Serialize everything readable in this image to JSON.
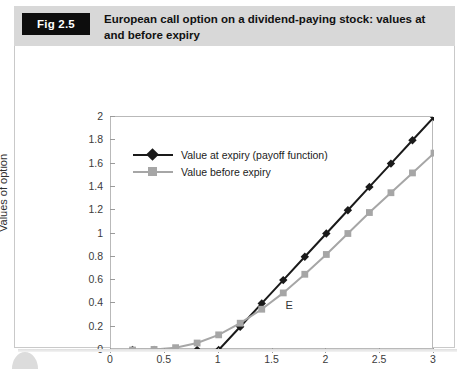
{
  "figure": {
    "badge": "Fig 2.5",
    "title": "European call option on a dividend-paying stock: values at and before expiry"
  },
  "colors": {
    "series_at_expiry": "#1a1a1a",
    "series_before_expiry": "#a6a6a6",
    "header_band": "#d8d8d8",
    "badge_bg": "#0d0d0d",
    "axis": "#b9b9b9"
  },
  "chart_data": {
    "type": "line",
    "title": "European call option on a dividend-paying stock: values at and before expiry",
    "xlabel": "Value of underlying asset",
    "ylabel": "Values of option",
    "xlim": [
      0,
      3
    ],
    "ylim": [
      0,
      2
    ],
    "xticks": [
      0,
      0.5,
      1,
      1.5,
      2,
      2.5,
      3
    ],
    "xtick_labels": [
      "0",
      "0.5",
      "1",
      "1.5",
      "2",
      "2.5",
      "3"
    ],
    "yticks": [
      0,
      0.2,
      0.4,
      0.6,
      0.8,
      1,
      1.2,
      1.4,
      1.6,
      1.8,
      2
    ],
    "ytick_labels": [
      "0",
      "0.2",
      "0.4",
      "0.6",
      "0.8",
      "1",
      "1.2",
      "1.4",
      "1.6",
      "1.8",
      "2"
    ],
    "grid": false,
    "legend_position": "upper left inside",
    "annotations": [
      {
        "text": "E",
        "x": 1.63,
        "y": 0.36
      }
    ],
    "x": [
      0.2,
      0.4,
      0.6,
      0.8,
      1.0,
      1.2,
      1.4,
      1.6,
      1.8,
      2.0,
      2.2,
      2.4,
      2.6,
      2.8,
      3.0
    ],
    "series": [
      {
        "name": "Value at expiry (payoff function)",
        "marker": "diamond",
        "color": "#1a1a1a",
        "values": [
          0,
          0,
          0,
          0,
          0,
          0.2,
          0.4,
          0.6,
          0.8,
          1.0,
          1.2,
          1.4,
          1.6,
          1.8,
          2.0
        ]
      },
      {
        "name": "Value before expiry",
        "marker": "square",
        "color": "#a6a6a6",
        "values": [
          0.0,
          0.005,
          0.02,
          0.06,
          0.13,
          0.23,
          0.35,
          0.49,
          0.65,
          0.82,
          1.0,
          1.18,
          1.35,
          1.52,
          1.69
        ]
      }
    ]
  },
  "legend": {
    "items": [
      {
        "label": "Value at expiry (payoff function)"
      },
      {
        "label": "Value before expiry"
      }
    ]
  }
}
